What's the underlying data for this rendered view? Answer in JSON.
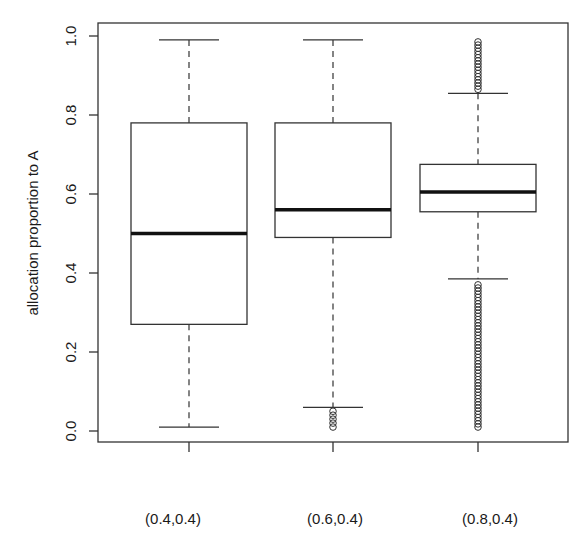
{
  "chart_data": {
    "type": "boxplot",
    "title": "",
    "xlabel": "",
    "ylabel": "allocation proportion to A",
    "ylim": [
      0.0,
      1.0
    ],
    "yticks": [
      0.0,
      0.2,
      0.4,
      0.6,
      0.8,
      1.0
    ],
    "ytick_labels": [
      "0.0",
      "0.2",
      "0.4",
      "0.6",
      "0.8",
      "1.0"
    ],
    "categories": [
      "(0.4,0.4)",
      "(0.6,0.4)",
      "(0.8,0.4)"
    ],
    "grid": false,
    "legend": null,
    "boxes": [
      {
        "label": "(0.4,0.4)",
        "whisker_low": 0.01,
        "q1": 0.27,
        "median": 0.5,
        "q3": 0.78,
        "whisker_high": 0.99,
        "outliers_low": [],
        "outliers_high": []
      },
      {
        "label": "(0.6,0.4)",
        "whisker_low": 0.06,
        "q1": 0.49,
        "median": 0.56,
        "q3": 0.78,
        "whisker_high": 0.99,
        "outliers_low": [
          0.01,
          0.02,
          0.03,
          0.04,
          0.05
        ],
        "outliers_high": []
      },
      {
        "label": "(0.8,0.4)",
        "whisker_low": 0.385,
        "q1": 0.555,
        "median": 0.605,
        "q3": 0.675,
        "whisker_high": 0.855,
        "outliers_low_range": [
          0.01,
          0.375
        ],
        "outliers_high_range": [
          0.865,
          0.99
        ]
      }
    ]
  }
}
